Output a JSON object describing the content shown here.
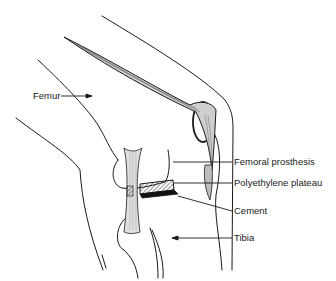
{
  "diagram": {
    "labels": [
      {
        "id": "femur",
        "text": "Femur",
        "x": 33,
        "y": 92
      },
      {
        "id": "femoral-prosthesis",
        "text": "Femoral prosthesis",
        "x": 234,
        "y": 158
      },
      {
        "id": "polyethylene-plateau",
        "text": "Polyethylene plateau",
        "x": 234,
        "y": 179
      },
      {
        "id": "cement",
        "text": "Cement",
        "x": 234,
        "y": 207
      },
      {
        "id": "tibia",
        "text": "Tibia",
        "x": 234,
        "y": 234
      }
    ],
    "colors": {
      "line": "#1a1a1a",
      "background": "#ffffff",
      "hatch": "#333333"
    }
  }
}
